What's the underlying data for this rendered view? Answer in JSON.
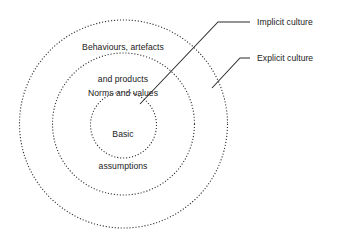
{
  "diagram": {
    "background_color": "#ffffff",
    "stroke_color": "#2b2b2b",
    "text_color": "#1a1a1a",
    "rings": [
      {
        "id": "outer",
        "label_line1": "Behaviours, artefacts",
        "label_line2": "and products",
        "cx": 123.5,
        "cy": 124,
        "r": 104,
        "style": "dotted"
      },
      {
        "id": "middle",
        "label_line1": "Norms and values",
        "label_line2": "",
        "cx": 123.5,
        "cy": 124,
        "r": 71,
        "style": "dotted"
      },
      {
        "id": "inner",
        "label_line1": "Basic",
        "label_line2": "assumptions",
        "cx": 123.5,
        "cy": 125,
        "r": 33,
        "style": "dotted"
      }
    ],
    "callouts": [
      {
        "id": "implicit",
        "label": "Implicit culture",
        "leader_h_start_x": 250,
        "leader_h_end_x": 218,
        "leader_y": 22,
        "leader_tip_x": 140,
        "leader_tip_y": 104,
        "label_x": 257,
        "label_y": 22
      },
      {
        "id": "explicit",
        "label": "Explicit culture",
        "leader_h_start_x": 250,
        "leader_h_end_x": 240,
        "leader_y": 58,
        "leader_tip_x": 212,
        "leader_tip_y": 88,
        "label_x": 257,
        "label_y": 58
      }
    ]
  }
}
